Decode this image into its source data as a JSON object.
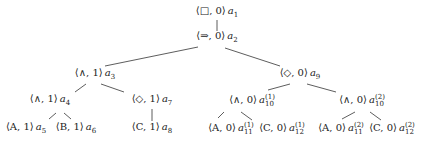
{
  "nodes": [
    {
      "id": "a1",
      "tuple": "⟨□, 0⟩",
      "label": "a",
      "sub": "1",
      "sup": "",
      "x": 217,
      "y": 13
    },
    {
      "id": "a2",
      "tuple": "⟨⇒, 0⟩",
      "label": "a",
      "sub": "2",
      "sup": "",
      "x": 217,
      "y": 38
    },
    {
      "id": "a3",
      "tuple": "⟨∧, 1⟩",
      "label": "a",
      "sub": "3",
      "sup": "",
      "x": 95,
      "y": 75
    },
    {
      "id": "a9",
      "tuple": "⟨◇, 0⟩",
      "label": "a",
      "sub": "9",
      "sup": "",
      "x": 300,
      "y": 75
    },
    {
      "id": "a4",
      "tuple": "⟨∧, 1⟩",
      "label": "a",
      "sub": "4",
      "sup": "",
      "x": 50,
      "y": 101
    },
    {
      "id": "a7",
      "tuple": "⟨◇, 1⟩",
      "label": "a",
      "sub": "7",
      "sup": "",
      "x": 152,
      "y": 101
    },
    {
      "id": "a5",
      "tuple": "⟨A, 1⟩",
      "label": "a",
      "sub": "5",
      "sup": "",
      "x": 26,
      "y": 129
    },
    {
      "id": "a6",
      "tuple": "⟨B, 1⟩",
      "label": "a",
      "sub": "6",
      "sup": "",
      "x": 76,
      "y": 129
    },
    {
      "id": "a8",
      "tuple": "⟨C, 1⟩",
      "label": "a",
      "sub": "8",
      "sup": "",
      "x": 152,
      "y": 129
    },
    {
      "id": "a10_1",
      "tuple": "⟨∧, 0⟩",
      "label": "a",
      "sub": "10",
      "sup": "(1)",
      "x": 252,
      "y": 101
    },
    {
      "id": "a10_2",
      "tuple": "⟨∧, 0⟩",
      "label": "a",
      "sub": "10",
      "sup": "(2)",
      "x": 362,
      "y": 101
    },
    {
      "id": "a11_1",
      "tuple": "⟨A, 0⟩",
      "label": "a",
      "sub": "11",
      "sup": "(1)",
      "x": 231,
      "y": 129
    },
    {
      "id": "a12_1",
      "tuple": "⟨C, 0⟩",
      "label": "a",
      "sub": "12",
      "sup": "(1)",
      "x": 282,
      "y": 129
    },
    {
      "id": "a11_2",
      "tuple": "⟨A, 0⟩",
      "label": "a",
      "sub": "11",
      "sup": "(2)",
      "x": 341,
      "y": 129
    },
    {
      "id": "a12_2",
      "tuple": "⟨C, 0⟩",
      "label": "a",
      "sub": "12",
      "sup": "(2)",
      "x": 392,
      "y": 129
    }
  ],
  "edges": [
    {
      "from": "a1",
      "to": "a2",
      "x1": 217,
      "y1": 20,
      "x2": 217,
      "y2": 31
    },
    {
      "from": "a2",
      "to": "a3",
      "x1": 198,
      "y1": 47,
      "x2": 105,
      "y2": 66
    },
    {
      "from": "a2",
      "to": "a9",
      "x1": 225,
      "y1": 48,
      "x2": 280,
      "y2": 66
    },
    {
      "from": "a3",
      "to": "a4",
      "x1": 86,
      "y1": 84,
      "x2": 75,
      "y2": 92
    },
    {
      "from": "a3",
      "to": "a7",
      "x1": 101,
      "y1": 84,
      "x2": 124,
      "y2": 92
    },
    {
      "from": "a4",
      "to": "a5",
      "x1": 56,
      "y1": 113,
      "x2": 49,
      "y2": 119
    },
    {
      "from": "a4",
      "to": "a6",
      "x1": 64,
      "y1": 113,
      "x2": 71,
      "y2": 119
    },
    {
      "from": "a7",
      "to": "a8",
      "x1": 152,
      "y1": 109,
      "x2": 152,
      "y2": 121
    },
    {
      "from": "a9",
      "to": "a10_1",
      "x1": 290,
      "y1": 84,
      "x2": 268,
      "y2": 90
    },
    {
      "from": "a9",
      "to": "a10_2",
      "x1": 307,
      "y1": 84,
      "x2": 336,
      "y2": 92
    },
    {
      "from": "a10_1",
      "to": "a11_1",
      "x1": 224,
      "y1": 112,
      "x2": 218,
      "y2": 118
    },
    {
      "from": "a10_1",
      "to": "a12_1",
      "x1": 241,
      "y1": 112,
      "x2": 252,
      "y2": 120
    },
    {
      "from": "a10_2",
      "to": "a11_2",
      "x1": 355,
      "y1": 112,
      "x2": 342,
      "y2": 119
    },
    {
      "from": "a10_2",
      "to": "a12_2",
      "x1": 370,
      "y1": 112,
      "x2": 381,
      "y2": 120
    }
  ],
  "colors": {
    "line": "#333333",
    "text": "#222222",
    "background": "#ffffff"
  }
}
